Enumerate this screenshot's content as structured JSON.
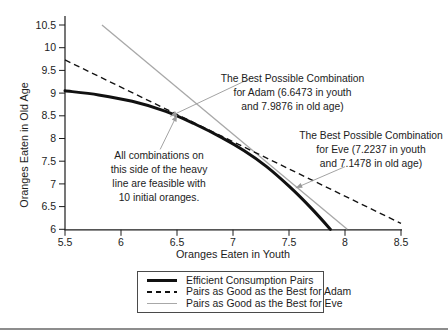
{
  "chart_data": {
    "type": "line",
    "title": "",
    "xlabel": "Oranges Eaten in Youth",
    "ylabel": "Oranges Eaten in Old Age",
    "xlim": [
      5.5,
      8.5
    ],
    "ylim": [
      6,
      10.5
    ],
    "x_ticks": [
      5.5,
      6,
      6.5,
      7,
      7.5,
      8,
      8.5
    ],
    "y_ticks": [
      6,
      6.5,
      7,
      7.5,
      8,
      8.5,
      9,
      9.5,
      10,
      10.5
    ],
    "grid": false,
    "legend_position": "bottom-center",
    "series": [
      {
        "name": "Efficient Consumption Pairs",
        "style": "solid-thick",
        "color": "#111111",
        "points": [
          [
            5.5,
            9.05
          ],
          [
            5.8,
            8.96
          ],
          [
            6.1,
            8.82
          ],
          [
            6.4,
            8.6
          ],
          [
            6.65,
            8.33
          ],
          [
            6.9,
            8.02
          ],
          [
            7.1,
            7.73
          ],
          [
            7.3,
            7.38
          ],
          [
            7.5,
            6.95
          ],
          [
            7.7,
            6.46
          ],
          [
            7.87,
            6.0
          ]
        ]
      },
      {
        "name": "Pairs as Good as the Best for Adam",
        "style": "dashed",
        "color": "#111111",
        "points": [
          [
            5.5,
            9.73
          ],
          [
            8.5,
            6.13
          ]
        ]
      },
      {
        "name": "Pairs as Good as the Best for Eve",
        "style": "solid-thin",
        "color": "#a8a8a8",
        "points": [
          [
            5.83,
            10.5
          ],
          [
            8.02,
            6.0
          ]
        ]
      }
    ],
    "key_points": [
      {
        "name": "adam_best_combination",
        "x": 6.6473,
        "y": 7.9876
      },
      {
        "name": "eve_best_combination",
        "x": 7.2237,
        "y": 7.1478
      }
    ],
    "leaders": [
      {
        "name": "adam-leader",
        "from": [
          7.16,
          9.33
        ],
        "to": [
          6.44,
          8.49
        ]
      },
      {
        "name": "feasible-leader",
        "from": [
          6.35,
          7.76
        ],
        "to": [
          6.5,
          8.52
        ]
      },
      {
        "name": "eve-leader",
        "from": [
          8.0,
          7.38
        ],
        "to": [
          7.56,
          6.91
        ]
      }
    ]
  },
  "annotations": {
    "adam": {
      "line1": "The Best Possible Combination",
      "line2": "for Adam (6.6473 in youth",
      "line3": "and 7.9876 in old age)"
    },
    "eve": {
      "line1": "The Best Possible Combination",
      "line2": "for Eve (7.2237 in youth",
      "line3": "and 7.1478 in old age)"
    },
    "feasible": {
      "line1": "All combinations on",
      "line2": "this side of the heavy",
      "line3": "line are feasible with",
      "line4": "10 initial oranges."
    }
  },
  "legend": {
    "items": [
      {
        "label": "Efficient Consumption Pairs",
        "swatch": "solid-thick"
      },
      {
        "label": "Pairs as Good as the Best for Adam",
        "swatch": "dashed"
      },
      {
        "label": "Pairs as Good as the Best for Eve",
        "swatch": "solid-gray"
      }
    ]
  },
  "colors": {
    "ink": "#1c1c1c",
    "curve": "#111111",
    "eve_line": "#a8a8a8",
    "leader": "#999999",
    "divider": "#8d8d8d"
  }
}
